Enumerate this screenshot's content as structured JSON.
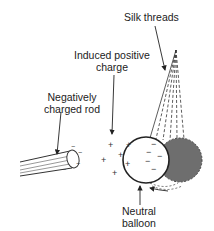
{
  "labels": {
    "silk_threads": "Silk threads",
    "induced_positive_line1": "Induced positive",
    "induced_positive_line2": "charge",
    "rod_line1": "Negatively",
    "rod_line2": "charged rod",
    "balloon_line1": "Neutral",
    "balloon_line2": "balloon"
  },
  "symbols": {
    "plus": "+",
    "minus": "−"
  },
  "colors": {
    "ink": "#222222",
    "displaced_balloon": "#6e6e6e",
    "background": "#ffffff"
  }
}
